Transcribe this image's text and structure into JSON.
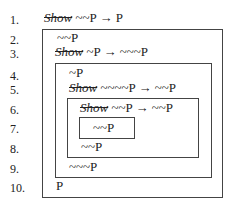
{
  "proof": {
    "lines": [
      {
        "num": "1.",
        "show": "Show",
        "formula": "~~P → P"
      },
      {
        "num": "2.",
        "show": "",
        "formula": "~~P"
      },
      {
        "num": "3.",
        "show": "Show",
        "formula": "~P → ~~~P"
      },
      {
        "num": "4.",
        "show": "",
        "formula": "~P"
      },
      {
        "num": "5.",
        "show": "Show",
        "formula": "~~~~P → ~~P"
      },
      {
        "num": "6.",
        "show": "Show",
        "formula": "~~P → ~~P"
      },
      {
        "num": "7.",
        "show": "",
        "formula": "~~P"
      },
      {
        "num": "8.",
        "show": "",
        "formula": "~~P"
      },
      {
        "num": "9.",
        "show": "",
        "formula": "~~~P"
      },
      {
        "num": "10.",
        "show": "",
        "formula": "P"
      }
    ]
  }
}
